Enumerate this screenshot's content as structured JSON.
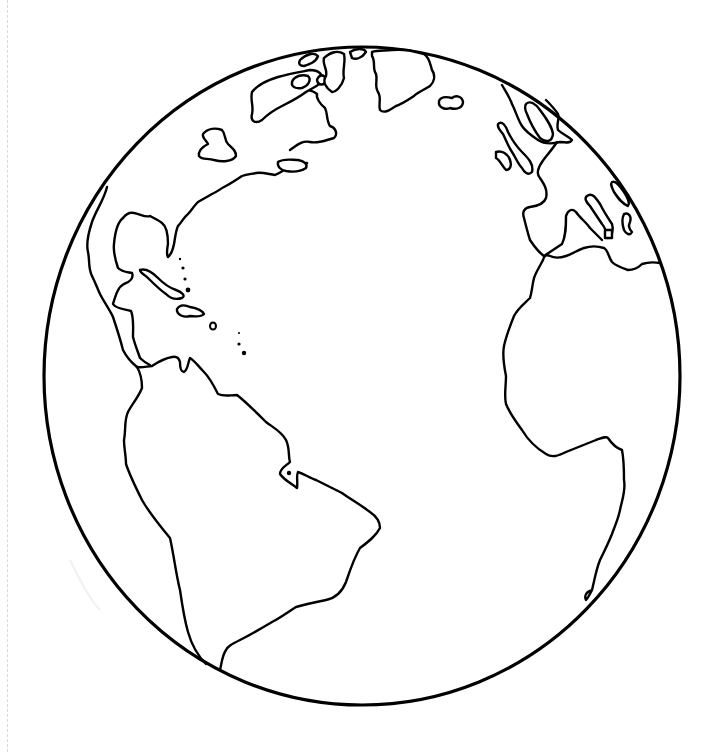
{
  "image": {
    "title": "Earth globe outline coloring page",
    "subject": "Atlantic-centered hemisphere line drawing",
    "colors": {
      "line": "#000000",
      "background": "#ffffff",
      "page_edge": "#d8d8d8"
    },
    "regions_depicted": [
      "North America",
      "Greenland",
      "Iceland",
      "Caribbean islands",
      "South America",
      "Europe",
      "Africa",
      "Atlantic Ocean"
    ]
  }
}
